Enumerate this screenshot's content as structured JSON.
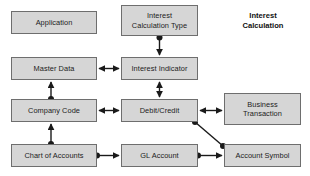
{
  "diagram": {
    "title": "Interest\nCalculation",
    "title_position": {
      "x": 221,
      "y": 11,
      "width": 84
    },
    "style": {
      "node_fill": "#d6d6d6",
      "node_border": "#6e6e6e",
      "edge_color": "#1a1a1a",
      "background": "#ffffff",
      "text_color": "#1c1c1c"
    },
    "nodes": [
      {
        "id": "application",
        "label": "Application",
        "x": 11,
        "y": 11,
        "w": 86,
        "h": 23
      },
      {
        "id": "interest-calculation-type",
        "label": "Interest\nCalculation Type",
        "x": 121,
        "y": 5,
        "w": 77,
        "h": 31
      },
      {
        "id": "master-data",
        "label": "Master Data",
        "x": 11,
        "y": 57,
        "w": 86,
        "h": 23
      },
      {
        "id": "interest-indicator",
        "label": "Interest Indicator",
        "x": 121,
        "y": 57,
        "w": 77,
        "h": 23
      },
      {
        "id": "company-code",
        "label": "Company Code",
        "x": 11,
        "y": 99,
        "w": 86,
        "h": 23
      },
      {
        "id": "debit-credit",
        "label": "Debit/Credit",
        "x": 121,
        "y": 99,
        "w": 77,
        "h": 23
      },
      {
        "id": "business-transaction",
        "label": "Business\nTransaction",
        "x": 224,
        "y": 93,
        "w": 77,
        "h": 32
      },
      {
        "id": "chart-of-accounts",
        "label": "Chart of Accounts",
        "x": 11,
        "y": 144,
        "w": 86,
        "h": 23
      },
      {
        "id": "gl-account",
        "label": "GL Account",
        "x": 121,
        "y": 144,
        "w": 77,
        "h": 23
      },
      {
        "id": "account-symbol",
        "label": "Account Symbol",
        "x": 224,
        "y": 144,
        "w": 77,
        "h": 23
      }
    ],
    "edges": [
      {
        "id": "edge-calc-type-to-indicator",
        "from": "interest-calculation-type",
        "to": "interest-indicator",
        "path": "M159.5,36 L159.5,55",
        "arrows": "end",
        "dots": [
          {
            "x": 159.5,
            "y": 37.5
          }
        ]
      },
      {
        "id": "edge-master-data-to-indicator",
        "from": "master-data",
        "to": "interest-indicator",
        "path": "M99,68.5 L119,68.5",
        "arrows": "both",
        "dots": []
      },
      {
        "id": "edge-indicator-to-debit-credit",
        "from": "interest-indicator",
        "to": "debit-credit",
        "path": "M159.5,82 L159.5,97",
        "arrows": "both",
        "dots": []
      },
      {
        "id": "edge-company-code-to-master-data",
        "from": "company-code",
        "to": "master-data",
        "path": "M51,98.5 L51,82",
        "arrows": "end",
        "dots": [
          {
            "x": 51,
            "y": 99
          }
        ]
      },
      {
        "id": "edge-company-code-to-debit-credit",
        "from": "company-code",
        "to": "debit-credit",
        "path": "M99,110.5 L119,110.5",
        "arrows": "both",
        "dots": []
      },
      {
        "id": "edge-debit-credit-to-business-transaction",
        "from": "debit-credit",
        "to": "business-transaction",
        "path": "M200,110.5 L222,110.5",
        "arrows": "both",
        "dots": []
      },
      {
        "id": "edge-chart-of-accounts-to-company-code",
        "from": "chart-of-accounts",
        "to": "company-code",
        "path": "M51,143.5 L51,124",
        "arrows": "end",
        "dots": [
          {
            "x": 51,
            "y": 144
          }
        ]
      },
      {
        "id": "edge-chart-of-accounts-to-gl-account",
        "from": "chart-of-accounts",
        "to": "gl-account",
        "path": "M97,155.5 L119,155.5",
        "arrows": "end",
        "dots": [
          {
            "x": 97,
            "y": 155.5
          }
        ]
      },
      {
        "id": "edge-gl-account-to-account-symbol",
        "from": "gl-account",
        "to": "account-symbol",
        "path": "M198,155.5 L222,155.5",
        "arrows": "end",
        "dots": [
          {
            "x": 198,
            "y": 155.5
          }
        ]
      },
      {
        "id": "edge-debit-credit-to-account-symbol",
        "from": "debit-credit",
        "to": "account-symbol",
        "path": "M195,122 L223,146",
        "arrows": "none",
        "dots": [
          {
            "x": 195,
            "y": 122
          },
          {
            "x": 223,
            "y": 146
          }
        ]
      }
    ]
  }
}
